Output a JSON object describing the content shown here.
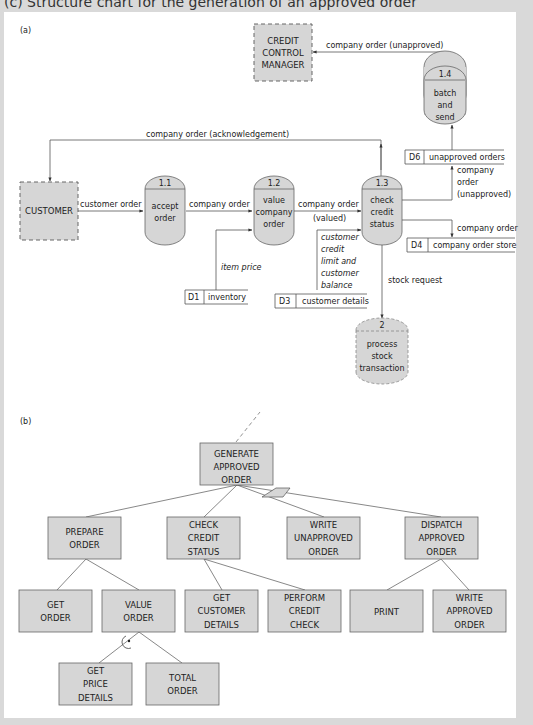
{
  "figure_title": "(c) Structure chart for the generation of an approved order",
  "part_a": {
    "label": "(a)",
    "external_entities": [
      {
        "id": "customer",
        "label": "CUSTOMER"
      },
      {
        "id": "ccm",
        "lines": [
          "CREDIT",
          "CONTROL",
          "MANAGER"
        ]
      }
    ],
    "processes": [
      {
        "id": "1.1",
        "lines": [
          "accept",
          "order"
        ]
      },
      {
        "id": "1.2",
        "lines": [
          "value",
          "company",
          "order"
        ]
      },
      {
        "id": "1.3",
        "lines": [
          "check",
          "credit",
          "status"
        ]
      },
      {
        "id": "1.4",
        "lines": [
          "batch",
          "and",
          "send"
        ]
      },
      {
        "id": "2",
        "lines": [
          "process",
          "stock",
          "transaction"
        ]
      }
    ],
    "data_stores": [
      {
        "id": "D1",
        "name": "inventory"
      },
      {
        "id": "D3",
        "name": "customer details"
      },
      {
        "id": "D4",
        "name": "company order store"
      },
      {
        "id": "D6",
        "name": "unapproved orders"
      }
    ],
    "flows": {
      "customer_order": "customer order",
      "company_order_1": "company order",
      "company_order_valued_1": "company order",
      "company_order_valued_2": "(valued)",
      "acknowledgement": "company order (acknowledgement)",
      "unapproved_top": "company order (unapproved)",
      "unapproved_side": [
        "company",
        "order",
        "(unapproved)"
      ],
      "to_store": "company order",
      "item_price": "item price",
      "credit_info": [
        "customer",
        "credit",
        "limit and",
        "customer",
        "balance"
      ],
      "stock_request": "stock request"
    }
  },
  "part_b": {
    "label": "(b)",
    "root": [
      "GENERATE",
      "APPROVED",
      "ORDER"
    ],
    "level1": [
      {
        "lines": [
          "PREPARE",
          "ORDER"
        ]
      },
      {
        "lines": [
          "CHECK",
          "CREDIT",
          "STATUS"
        ]
      },
      {
        "lines": [
          "WRITE",
          "UNAPPROVED",
          "ORDER"
        ]
      },
      {
        "lines": [
          "DISPATCH",
          "APPROVED",
          "ORDER"
        ]
      }
    ],
    "level2": [
      {
        "lines": [
          "GET",
          "ORDER"
        ]
      },
      {
        "lines": [
          "VALUE",
          "ORDER"
        ]
      },
      {
        "lines": [
          "GET",
          "CUSTOMER",
          "DETAILS"
        ]
      },
      {
        "lines": [
          "PERFORM",
          "CREDIT",
          "CHECK"
        ]
      },
      {
        "lines": [
          "PRINT"
        ]
      },
      {
        "lines": [
          "WRITE",
          "APPROVED",
          "ORDER"
        ]
      }
    ],
    "level3": [
      {
        "lines": [
          "GET",
          "PRICE",
          "DETAILS"
        ]
      },
      {
        "lines": [
          "TOTAL",
          "ORDER"
        ]
      }
    ]
  },
  "colors": {
    "box_fill": "#d6d6d6",
    "stroke": "#555555",
    "panel": "#ffffff",
    "page": "#d9d9d9"
  }
}
